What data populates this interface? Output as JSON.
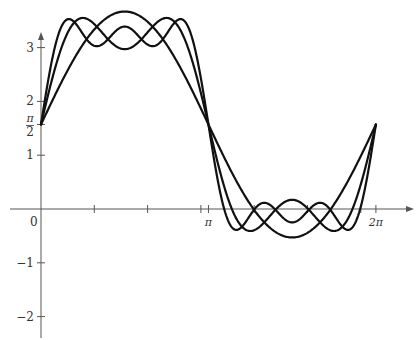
{
  "chart_data": {
    "type": "line",
    "title": "",
    "xlabel": "",
    "ylabel": "",
    "grid": false,
    "legend": null,
    "xlim": [
      -0.5,
      7.0
    ],
    "ylim": [
      -2.4,
      3.8
    ],
    "x_ticks": [
      {
        "value": 0,
        "label": "0"
      },
      {
        "value": 1,
        "label": ""
      },
      {
        "value": 2,
        "label": ""
      },
      {
        "value": 3,
        "label": ""
      },
      {
        "value": 3.14159,
        "label": "π"
      },
      {
        "value": 4,
        "label": ""
      },
      {
        "value": 5,
        "label": ""
      },
      {
        "value": 6,
        "label": ""
      },
      {
        "value": 6.28319,
        "label": "2π"
      }
    ],
    "y_ticks": [
      {
        "value": 3,
        "label": "3"
      },
      {
        "value": 2,
        "label": "2"
      },
      {
        "value": 1.5708,
        "label_num": "π",
        "label_den": "2"
      },
      {
        "value": 1,
        "label": "1"
      },
      {
        "value": -1,
        "label": "−1"
      },
      {
        "value": -2,
        "label": "−2"
      }
    ],
    "origin_label": "0",
    "series": [
      {
        "name": "partial sum 1",
        "formula": "π/2 + 2.1·sin(x)",
        "offset": 1.5708,
        "amplitude": 2.1,
        "odd_terms": 1,
        "x": [
          0,
          0.785,
          1.571,
          2.356,
          3.142,
          3.927,
          4.712,
          5.498,
          6.283
        ],
        "y": [
          1.57,
          3.06,
          3.67,
          3.06,
          1.57,
          0.08,
          -0.53,
          0.08,
          1.57
        ]
      },
      {
        "name": "partial sum 2",
        "formula": "π/2 + 2.1·(sin x + sin 3x / 3)",
        "offset": 1.5708,
        "amplitude": 2.1,
        "odd_terms": 2,
        "x": [
          0,
          0.785,
          1.571,
          2.356,
          3.142,
          3.927,
          4.712,
          5.498,
          6.283
        ],
        "y": [
          1.57,
          3.55,
          2.97,
          3.55,
          1.57,
          -0.41,
          0.17,
          -0.41,
          1.57
        ]
      },
      {
        "name": "partial sum 3",
        "formula": "π/2 + 2.1·(sin x + sin 3x / 3 + sin 5x / 5)",
        "offset": 1.5708,
        "amplitude": 2.1,
        "odd_terms": 3,
        "x": [
          0,
          0.524,
          1.047,
          1.571,
          2.094,
          2.618,
          3.142,
          3.665,
          4.189,
          4.712,
          5.236,
          5.76,
          6.283
        ],
        "y": [
          1.57,
          3.53,
          3.33,
          3.39,
          3.33,
          3.53,
          1.57,
          -0.39,
          -0.19,
          -0.25,
          -0.19,
          -0.39,
          1.57
        ]
      }
    ]
  },
  "style": {
    "curve_color": "#111111",
    "axis_color": "#555555",
    "background": "#ffffff"
  }
}
